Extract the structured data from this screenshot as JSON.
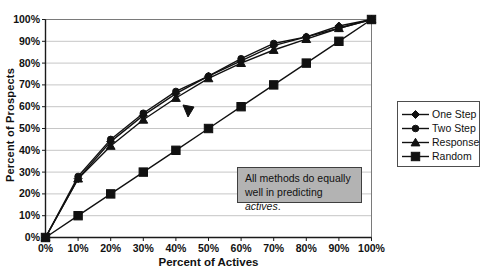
{
  "colors": {
    "ink": "#111111",
    "gridline": "#c6c6c6",
    "plot_border": "#7a7a7a",
    "axis": "#1a1a1a",
    "callout_fill": "#b3b3b3"
  },
  "annotation": {
    "text_normal": "All methods do equally well in predicting ",
    "text_italic": "actives",
    "text_suffix": "."
  },
  "chart_data": {
    "type": "line",
    "title": "",
    "xlabel": "Percent of Actives",
    "ylabel": "Percent of Prospects",
    "x": [
      0,
      10,
      20,
      30,
      40,
      50,
      60,
      70,
      80,
      90,
      100
    ],
    "x_tick_labels": [
      "0%",
      "10%",
      "20%",
      "30%",
      "40%",
      "50%",
      "60%",
      "70%",
      "80%",
      "90%",
      "100%"
    ],
    "y_ticks": [
      0,
      10,
      20,
      30,
      40,
      50,
      60,
      70,
      80,
      90,
      100
    ],
    "y_tick_labels": [
      "0%",
      "10%",
      "20%",
      "30%",
      "40%",
      "50%",
      "60%",
      "70%",
      "80%",
      "90%",
      "100%"
    ],
    "ylim": [
      0,
      100
    ],
    "xlim": [
      0,
      100
    ],
    "grid": "horizontal",
    "legend_position": "right",
    "series": [
      {
        "name": "One Step",
        "marker": "diamond",
        "values": [
          0,
          27,
          44,
          56,
          66,
          74,
          81,
          88,
          92,
          97,
          100
        ]
      },
      {
        "name": "Two Step",
        "marker": "circle",
        "values": [
          0,
          28,
          45,
          57,
          67,
          74,
          82,
          89,
          92,
          96,
          100
        ]
      },
      {
        "name": "Response",
        "marker": "triangle",
        "values": [
          0,
          27,
          42,
          54,
          64,
          73,
          80,
          86,
          91,
          96,
          100
        ]
      },
      {
        "name": "Random",
        "marker": "square",
        "values": [
          0,
          10,
          20,
          30,
          40,
          50,
          60,
          70,
          80,
          90,
          100
        ]
      }
    ],
    "annotations": [
      "arrowhead pointing at model curves near 40-50% of actives",
      "gray callout box: All methods do equally well in predicting actives."
    ]
  }
}
